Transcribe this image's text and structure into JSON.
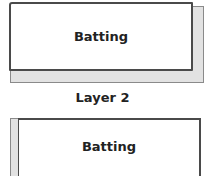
{
  "diagram": {
    "layer1": {
      "box_label": "Batting",
      "fill_color": "#ffffff",
      "underlayer_color": "#e2e2e2"
    },
    "caption": "Layer 2",
    "layer2": {
      "box_label": "Batting",
      "fill_color": "#ffffff",
      "underlayer_color": "#e2e2e2"
    }
  }
}
